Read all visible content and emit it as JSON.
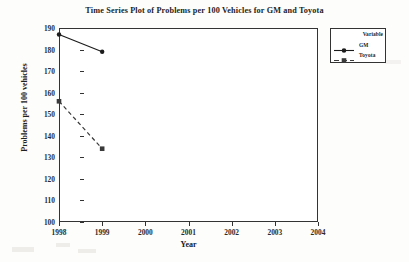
{
  "chart_data": {
    "type": "line",
    "title": "Time Series Plot of Problems per 100 Vehicles for GM and Toyota",
    "xlabel": "Year",
    "ylabel": "Problems per 100 vehicles",
    "x": [
      1998,
      1999,
      2000,
      2001,
      2002,
      2003,
      2004
    ],
    "xticklabels": [
      "1998",
      "1999",
      "2000",
      "2001",
      "2002",
      "2003",
      "2004"
    ],
    "xlim": [
      1998,
      2004
    ],
    "ylim": [
      100,
      190
    ],
    "yticks": [
      100,
      110,
      120,
      130,
      140,
      150,
      160,
      170,
      180,
      190
    ],
    "yticklabels": [
      "100",
      "110",
      "120",
      "130",
      "140",
      "150",
      "160",
      "170",
      "180",
      "190"
    ],
    "grid": false,
    "legend_position": "outside-top-right",
    "legend_title": "Variable",
    "series": [
      {
        "name": "GM",
        "x": [
          1998,
          1999
        ],
        "values": [
          187,
          179
        ],
        "linestyle": "solid",
        "marker": "circle",
        "color": "#1c1c1c"
      },
      {
        "name": "Toyota",
        "x": [
          1998,
          1999
        ],
        "values": [
          156,
          134
        ],
        "linestyle": "dashed",
        "marker": "square",
        "color": "#3a3a3a"
      }
    ]
  },
  "legend": {
    "title": "Variable",
    "items": [
      {
        "label": "GM"
      },
      {
        "label": "Toyota"
      }
    ]
  },
  "colors": {
    "axis": "#333333",
    "text": "#202020",
    "background": "#fdfdfc",
    "plot_background": "#ffffff"
  }
}
